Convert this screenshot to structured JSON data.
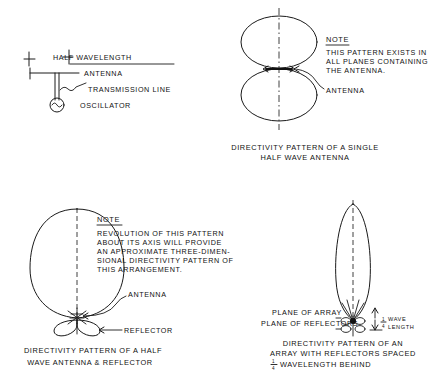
{
  "figure": {
    "ink_color": "#111111",
    "background_color": "#ffffff"
  },
  "schematic": {
    "name": "half-wavelength-antenna-schematic",
    "dimension_label": "HALF WAVELENGTH",
    "antenna_label": "ANTENNA",
    "transmission_line_label": "TRANSMISSION LINE",
    "oscillator_label": "OSCILLATOR",
    "oscillator_symbol": "sine-wave-in-circle"
  },
  "panel_single": {
    "name": "single-half-wave-antenna-pattern",
    "note_heading": "NOTE",
    "note_lines": [
      "THIS PATTERN EXISTS IN",
      "ALL PLANES CONTAINING",
      "THE ANTENNA."
    ],
    "antenna_label": "ANTENNA",
    "caption_lines": [
      "DIRECTIVITY  PATTERN  OF A  SINGLE",
      "HALF  WAVE  ANTENNA"
    ],
    "pattern_type": "figure-eight-two-lobes"
  },
  "panel_reflector": {
    "name": "half-wave-antenna-and-reflector-pattern",
    "note_heading": "NOTE",
    "note_lines": [
      "REVOLUTION OF THIS PATTERN",
      "ABOUT ITS AXIS WILL PROVIDE",
      "AN APPROXIMATE  THREE-DIMEN-",
      "SIONAL DIRECTIVITY PATTERN OF",
      "THIS ARRANGEMENT."
    ],
    "antenna_label": "ANTENNA",
    "reflector_label": "REFLECTOR",
    "caption_lines": [
      "DIRECTIVITY  PATTERN  OF A HALF",
      "WAVE  ANTENNA  &  REFLECTOR"
    ],
    "pattern_type": "single-large-lobe-with-small-back-lobes"
  },
  "panel_array": {
    "name": "array-with-reflectors-pattern",
    "plane_of_array_label": "PLANE OF ARRAY",
    "plane_of_reflectors_label": "PLANE OF REFLECTORS",
    "spacing_numerator": "1",
    "spacing_denominator": "4",
    "spacing_unit_line1": "WAVE",
    "spacing_unit_line2": "LENGTH",
    "caption_lines": [
      "DIRECTIVITY  PATTERN  OF AN",
      "ARRAY  WITH  REFLECTORS  SPACED",
      "WAVELENGTH  BEHIND"
    ],
    "caption_fraction_numerator": "1",
    "caption_fraction_denominator": "4",
    "pattern_type": "narrow-tall-lobe"
  }
}
